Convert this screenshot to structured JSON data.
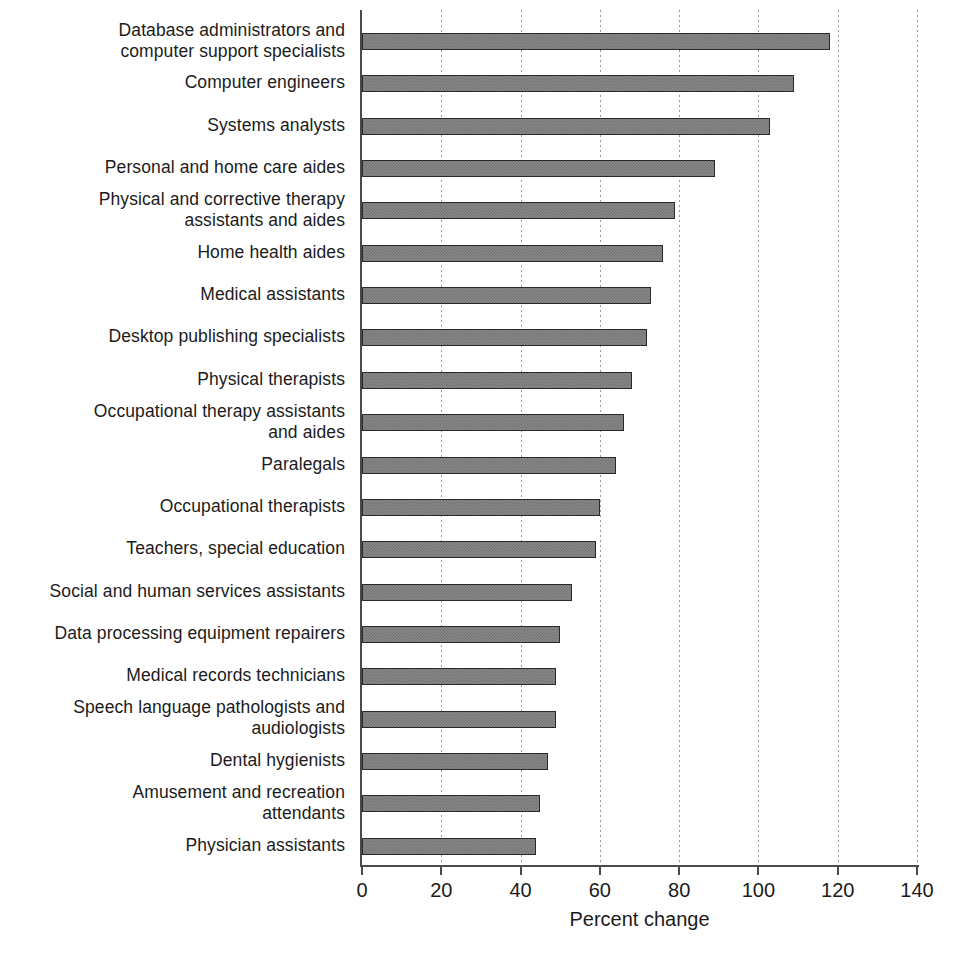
{
  "chart_data": {
    "type": "bar",
    "orientation": "horizontal",
    "title": "",
    "xlabel": "Percent change",
    "ylabel": "",
    "xlim": [
      0,
      140
    ],
    "xticks": [
      0,
      20,
      40,
      60,
      80,
      100,
      120,
      140
    ],
    "xtick_labels": [
      "0",
      "20",
      "40",
      "60",
      "80",
      "100",
      "120",
      "140"
    ],
    "grid": "vertical-dotted",
    "legend": "none",
    "bar_color": "#8a8a8a",
    "bar_border_color": "#2a2a2a",
    "categories": [
      "Database administrators and\ncomputer support specialists",
      "Computer engineers",
      "Systems analysts",
      "Personal and home care aides",
      "Physical and corrective therapy\nassistants and aides",
      "Home health aides",
      "Medical assistants",
      "Desktop publishing specialists",
      "Physical therapists",
      "Occupational therapy assistants\nand aides",
      "Paralegals",
      "Occupational therapists",
      "Teachers, special education",
      "Social and human services assistants",
      "Data processing equipment repairers",
      "Medical records technicians",
      "Speech language pathologists and\naudiologists",
      "Dental hygienists",
      "Amusement and recreation\nattendants",
      "Physician assistants"
    ],
    "values": [
      118,
      109,
      103,
      89,
      79,
      76,
      73,
      72,
      68,
      66,
      64,
      60,
      59,
      53,
      50,
      49,
      49,
      47,
      45,
      44
    ]
  }
}
